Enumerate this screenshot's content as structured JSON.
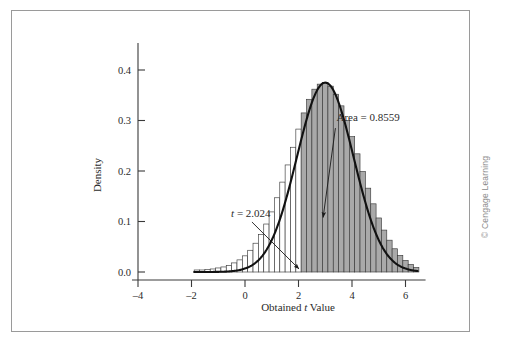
{
  "figure": {
    "copyright": "© Cengage Learning"
  },
  "chart_data": {
    "type": "bar",
    "title": "",
    "subtitle": "",
    "xlabel_prefix": "Obtained ",
    "xlabel_italic": "t",
    "xlabel_suffix": " Value",
    "ylabel": "Density",
    "xlim": [
      -5.0,
      7.0
    ],
    "ylim": [
      0.0,
      0.45
    ],
    "xticks": [
      -4,
      -2,
      0,
      2,
      4,
      6
    ],
    "xtick_labels": [
      "–4",
      "–2",
      "0",
      "2",
      "4",
      "6"
    ],
    "yticks": [
      0.0,
      0.1,
      0.2,
      0.3,
      0.4
    ],
    "ytick_labels": [
      "0.0",
      "0.1",
      "0.2",
      "0.3",
      "0.4"
    ],
    "grid": false,
    "legend": null,
    "bin_width": 0.2,
    "bin_starts": [
      -1.9,
      -1.7,
      -1.5,
      -1.3,
      -1.1,
      -0.9,
      -0.7,
      -0.5,
      -0.3,
      -0.1,
      0.1,
      0.3,
      0.5,
      0.7,
      0.9,
      1.1,
      1.3,
      1.5,
      1.7,
      1.9,
      2.1,
      2.3,
      2.5,
      2.7,
      2.9,
      3.1,
      3.3,
      3.5,
      3.7,
      3.9,
      4.1,
      4.3,
      4.5,
      4.7,
      4.9,
      5.1,
      5.3,
      5.5,
      5.7,
      5.9,
      6.1,
      6.3
    ],
    "values": [
      0.004,
      0.004,
      0.005,
      0.006,
      0.008,
      0.01,
      0.013,
      0.018,
      0.024,
      0.032,
      0.043,
      0.057,
      0.074,
      0.095,
      0.119,
      0.147,
      0.178,
      0.212,
      0.247,
      0.283,
      0.315,
      0.342,
      0.362,
      0.372,
      0.375,
      0.368,
      0.352,
      0.329,
      0.3,
      0.268,
      0.234,
      0.199,
      0.166,
      0.135,
      0.107,
      0.083,
      0.063,
      0.046,
      0.033,
      0.023,
      0.015,
      0.009
    ],
    "curve_mean": 3.0,
    "curve_sd": 1.06,
    "curve_peak": 0.375,
    "curve_xmin": -1.9,
    "curve_xmax": 6.45,
    "shade_threshold": 2.024,
    "shade_color": "#a9a9a9",
    "unshaded_color": "#ffffff",
    "bar_edge_color": "#3a3a3a",
    "curve_color": "#111111",
    "annotations": [
      {
        "id": "area-annotation",
        "text_prefix": "Area = ",
        "text_value": "0.8559",
        "text_x": 3.42,
        "text_y": 0.3,
        "arrow_from_x": 3.38,
        "arrow_from_y": 0.285,
        "arrow_to_x": 2.92,
        "arrow_to_y": 0.108
      },
      {
        "id": "t-critical-annotation",
        "text_italic": "t",
        "text_rest": " = 2.024",
        "text_x": -0.52,
        "text_y": 0.108,
        "arrow_from_x": 0.26,
        "arrow_from_y": 0.099,
        "arrow_to_x": 2.02,
        "arrow_to_y": 0.006
      }
    ]
  }
}
